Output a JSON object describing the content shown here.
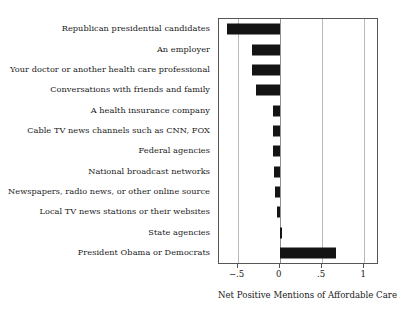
{
  "chart_data": {
    "type": "bar",
    "orientation": "horizontal",
    "title": "",
    "xlabel": "Net Positive Mentions of Affordable Care Act",
    "ylabel": "",
    "xlim": [
      -0.72,
      1.15
    ],
    "xticks": [
      -0.5,
      0,
      0.5,
      1
    ],
    "xticklabels": [
      "−.5",
      "0",
      ".5",
      "1"
    ],
    "grid": true,
    "gridlines_at": [
      -0.5,
      0,
      0.5,
      1
    ],
    "legend": "none",
    "bar_color": "#141414",
    "categories": [
      "Republican presidential candidates",
      "An employer",
      "Your doctor or another health care professional",
      "Conversations with friends and family",
      "A health insurance company",
      "Cable TV news channels such as CNN, FOX",
      "Federal agencies",
      "National broadcast networks",
      "Newspapers, radio news, or other online source",
      "Local TV news stations or their websites",
      "State agencies",
      "President Obama or Democrats"
    ],
    "values": [
      -0.62,
      -0.33,
      -0.33,
      -0.28,
      -0.08,
      -0.08,
      -0.08,
      -0.07,
      -0.06,
      -0.03,
      0.02,
      0.66
    ]
  },
  "axis": {
    "x_title": "Net Positive Mentions of Affordable Care Act",
    "tick_labels": [
      "−.5",
      "0",
      ".5",
      "1"
    ]
  }
}
